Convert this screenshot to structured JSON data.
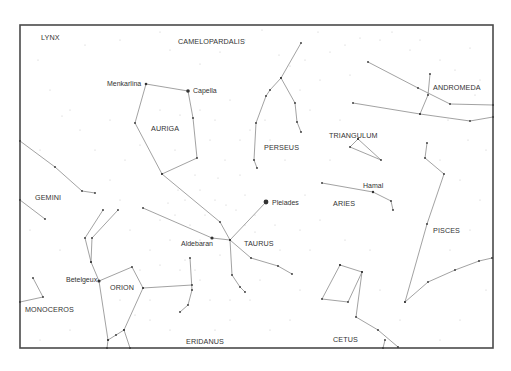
{
  "map": {
    "frame": {
      "x": 20,
      "y": 25,
      "width": 473,
      "height": 323
    },
    "colors": {
      "frame": "#4a4a4a",
      "lines": "#8a8a8a",
      "stars": "#333333",
      "background": "#ffffff"
    },
    "constellation_labels": [
      {
        "name": "LYNX",
        "x": 41,
        "y": 40
      },
      {
        "name": "CAMELOPARDALIS",
        "x": 178,
        "y": 44
      },
      {
        "name": "AURIGA",
        "x": 151,
        "y": 131
      },
      {
        "name": "PERSEUS",
        "x": 264,
        "y": 150
      },
      {
        "name": "TRIANGULUM",
        "x": 329,
        "y": 138
      },
      {
        "name": "ANDROMEDA",
        "x": 433,
        "y": 90
      },
      {
        "name": "GEMINI",
        "x": 35,
        "y": 200
      },
      {
        "name": "ARIES",
        "x": 333,
        "y": 206
      },
      {
        "name": "TAURUS",
        "x": 244,
        "y": 246
      },
      {
        "name": "PISCES",
        "x": 433,
        "y": 233
      },
      {
        "name": "ORION",
        "x": 110,
        "y": 290
      },
      {
        "name": "MONOCEROS",
        "x": 25,
        "y": 312
      },
      {
        "name": "ERIDANUS",
        "x": 186,
        "y": 344
      },
      {
        "name": "CETUS",
        "x": 333,
        "y": 342
      }
    ],
    "star_labels": [
      {
        "name": "Menkarlina",
        "x": 107,
        "y": 86,
        "anchor": "start"
      },
      {
        "name": "Capella",
        "x": 193,
        "y": 93,
        "anchor": "start"
      },
      {
        "name": "Pleiades",
        "x": 272,
        "y": 205,
        "anchor": "start"
      },
      {
        "name": "Hamal",
        "x": 363,
        "y": 188,
        "anchor": "start"
      },
      {
        "name": "Aldebaran",
        "x": 181,
        "y": 246,
        "anchor": "start"
      },
      {
        "name": "Betelgeux",
        "x": 66,
        "y": 282,
        "anchor": "start"
      }
    ],
    "named_stars": [
      {
        "name": "Menkarlina",
        "x": 146,
        "y": 84,
        "r": 1.3
      },
      {
        "name": "Capella",
        "x": 188,
        "y": 91,
        "r": 1.8
      },
      {
        "name": "Pleiades",
        "x": 266,
        "y": 202,
        "r": 2.4
      },
      {
        "name": "Hamal",
        "x": 373,
        "y": 192,
        "r": 1.2
      },
      {
        "name": "Aldebaran",
        "x": 212,
        "y": 238,
        "r": 1.6
      },
      {
        "name": "Betelgeux",
        "x": 99,
        "y": 281,
        "r": 1.6
      }
    ],
    "constellation_lines": [
      {
        "name": "auriga",
        "points": [
          [
            146,
            84
          ],
          [
            188,
            91
          ],
          [
            193,
            118
          ],
          [
            197,
            158
          ],
          [
            162,
            174
          ],
          [
            135,
            123
          ],
          [
            146,
            84
          ]
        ]
      },
      {
        "name": "auriga-taurus",
        "points": [
          [
            162,
            174
          ],
          [
            220,
            222
          ],
          [
            230,
            240
          ]
        ]
      },
      {
        "name": "perseus-main",
        "points": [
          [
            301,
            43
          ],
          [
            281,
            78
          ],
          [
            270,
            90
          ],
          [
            266,
            96
          ],
          [
            256,
            123
          ],
          [
            254,
            160
          ],
          [
            257,
            168
          ]
        ]
      },
      {
        "name": "perseus-branch",
        "points": [
          [
            281,
            78
          ],
          [
            295,
            103
          ],
          [
            297,
            122
          ],
          [
            301,
            132
          ]
        ]
      },
      {
        "name": "andromeda-upper",
        "points": [
          [
            368,
            62
          ],
          [
            418,
            88
          ],
          [
            450,
            104
          ],
          [
            493,
            105
          ]
        ]
      },
      {
        "name": "andromeda-lower",
        "points": [
          [
            353,
            103
          ],
          [
            420,
            114
          ],
          [
            470,
            121
          ],
          [
            493,
            117
          ]
        ]
      },
      {
        "name": "andromeda-branch",
        "points": [
          [
            430,
            74
          ],
          [
            428,
            95
          ],
          [
            420,
            114
          ]
        ]
      },
      {
        "name": "triangulum",
        "points": [
          [
            358,
            139
          ],
          [
            350,
            147
          ],
          [
            381,
            160
          ],
          [
            358,
            139
          ]
        ]
      },
      {
        "name": "aries",
        "points": [
          [
            322,
            183
          ],
          [
            373,
            192
          ],
          [
            391,
            201
          ],
          [
            393,
            210
          ]
        ]
      },
      {
        "name": "pisces-vertical",
        "points": [
          [
            427,
            143
          ],
          [
            425,
            158
          ],
          [
            444,
            174
          ],
          [
            427,
            224
          ],
          [
            405,
            302
          ]
        ]
      },
      {
        "name": "pisces-arc",
        "points": [
          [
            405,
            302
          ],
          [
            428,
            282
          ],
          [
            455,
            270
          ],
          [
            479,
            261
          ],
          [
            492,
            258
          ]
        ]
      },
      {
        "name": "cetus-box",
        "points": [
          [
            340,
            265
          ],
          [
            362,
            272
          ],
          [
            348,
            302
          ],
          [
            322,
            299
          ],
          [
            340,
            265
          ]
        ]
      },
      {
        "name": "cetus-tail",
        "points": [
          [
            362,
            272
          ],
          [
            356,
            317
          ],
          [
            378,
            330
          ],
          [
            398,
            347
          ]
        ]
      },
      {
        "name": "cetus-tick",
        "points": [
          [
            385,
            340
          ],
          [
            383,
            348
          ]
        ]
      },
      {
        "name": "taurus-pleiades",
        "points": [
          [
            230,
            240
          ],
          [
            266,
            202
          ]
        ]
      },
      {
        "name": "taurus-horn",
        "points": [
          [
            230,
            240
          ],
          [
            251,
            258
          ],
          [
            278,
            266
          ],
          [
            292,
            274
          ]
        ]
      },
      {
        "name": "taurus-aldebaran",
        "points": [
          [
            143,
            208
          ],
          [
            212,
            238
          ],
          [
            230,
            240
          ]
        ]
      },
      {
        "name": "taurus-lower",
        "points": [
          [
            230,
            240
          ],
          [
            232,
            275
          ],
          [
            240,
            287
          ],
          [
            245,
            292
          ]
        ]
      },
      {
        "name": "gemini-upper",
        "points": [
          [
            20,
            141
          ],
          [
            55,
            167
          ],
          [
            82,
            191
          ],
          [
            95,
            193
          ]
        ]
      },
      {
        "name": "gemini-lower",
        "points": [
          [
            20,
            200
          ],
          [
            45,
            219
          ]
        ]
      },
      {
        "name": "orion-shield",
        "points": [
          [
            190,
            258
          ],
          [
            192,
            290
          ],
          [
            188,
            305
          ],
          [
            180,
            312
          ]
        ]
      },
      {
        "name": "orion-belt-arm",
        "points": [
          [
            143,
            288
          ],
          [
            192,
            285
          ]
        ]
      },
      {
        "name": "orion-body",
        "points": [
          [
            99,
            281
          ],
          [
            132,
            267
          ],
          [
            143,
            288
          ],
          [
            124,
            330
          ],
          [
            116,
            335
          ],
          [
            108,
            340
          ]
        ]
      },
      {
        "name": "orion-left",
        "points": [
          [
            99,
            281
          ],
          [
            91,
            262
          ],
          [
            85,
            238
          ],
          [
            103,
            210
          ]
        ]
      },
      {
        "name": "orion-club",
        "points": [
          [
            91,
            262
          ],
          [
            92,
            238
          ],
          [
            118,
            210
          ]
        ]
      },
      {
        "name": "orion-leg",
        "points": [
          [
            99,
            281
          ],
          [
            108,
            340
          ],
          [
            107,
            348
          ]
        ]
      },
      {
        "name": "orion-foot",
        "points": [
          [
            124,
            330
          ],
          [
            130,
            348
          ]
        ]
      },
      {
        "name": "monoceros",
        "points": [
          [
            20,
            302
          ],
          [
            43,
            297
          ],
          [
            33,
            278
          ]
        ]
      }
    ],
    "background_stars": [
      [
        38,
        60
      ],
      [
        62,
        116
      ],
      [
        85,
        45
      ],
      [
        120,
        40
      ],
      [
        160,
        32
      ],
      [
        170,
        50
      ],
      [
        200,
        64
      ],
      [
        220,
        52
      ],
      [
        245,
        40
      ],
      [
        262,
        30
      ],
      [
        279,
        55
      ],
      [
        290,
        66
      ],
      [
        305,
        60
      ],
      [
        318,
        32
      ],
      [
        330,
        52
      ],
      [
        345,
        45
      ],
      [
        360,
        38
      ],
      [
        380,
        40
      ],
      [
        392,
        32
      ],
      [
        410,
        50
      ],
      [
        420,
        40
      ],
      [
        440,
        60
      ],
      [
        455,
        70
      ],
      [
        470,
        48
      ],
      [
        480,
        80
      ],
      [
        475,
        95
      ],
      [
        468,
        140
      ],
      [
        486,
        150
      ],
      [
        448,
        120
      ],
      [
        440,
        160
      ],
      [
        460,
        180
      ],
      [
        480,
        200
      ],
      [
        470,
        230
      ],
      [
        450,
        250
      ],
      [
        486,
        290
      ],
      [
        460,
        320
      ],
      [
        440,
        340
      ],
      [
        400,
        320
      ],
      [
        380,
        290
      ],
      [
        370,
        250
      ],
      [
        345,
        240
      ],
      [
        320,
        220
      ],
      [
        310,
        250
      ],
      [
        300,
        290
      ],
      [
        290,
        320
      ],
      [
        270,
        330
      ],
      [
        250,
        300
      ],
      [
        230,
        320
      ],
      [
        210,
        300
      ],
      [
        200,
        280
      ],
      [
        180,
        270
      ],
      [
        170,
        240
      ],
      [
        160,
        220
      ],
      [
        150,
        250
      ],
      [
        140,
        270
      ],
      [
        130,
        230
      ],
      [
        120,
        200
      ],
      [
        110,
        180
      ],
      [
        95,
        150
      ],
      [
        80,
        130
      ],
      [
        70,
        110
      ],
      [
        50,
        90
      ],
      [
        40,
        150
      ],
      [
        30,
        230
      ],
      [
        60,
        250
      ],
      [
        70,
        330
      ],
      [
        40,
        340
      ],
      [
        150,
        320
      ],
      [
        170,
        330
      ],
      [
        215,
        330
      ],
      [
        230,
        300
      ],
      [
        260,
        280
      ],
      [
        280,
        250
      ],
      [
        300,
        230
      ],
      [
        330,
        160
      ],
      [
        340,
        120
      ],
      [
        310,
        110
      ],
      [
        300,
        90
      ],
      [
        320,
        80
      ],
      [
        350,
        75
      ],
      [
        230,
        100
      ],
      [
        215,
        120
      ],
      [
        210,
        140
      ],
      [
        225,
        160
      ],
      [
        240,
        175
      ],
      [
        245,
        195
      ],
      [
        255,
        215
      ],
      [
        275,
        225
      ],
      [
        290,
        205
      ],
      [
        305,
        195
      ],
      [
        200,
        190
      ],
      [
        185,
        200
      ],
      [
        175,
        215
      ],
      [
        190,
        225
      ],
      [
        205,
        215
      ],
      [
        215,
        200
      ],
      [
        175,
        150
      ],
      [
        170,
        130
      ],
      [
        180,
        115
      ],
      [
        160,
        110
      ],
      [
        140,
        145
      ],
      [
        125,
        160
      ],
      [
        110,
        120
      ],
      [
        200,
        110
      ],
      [
        265,
        120
      ],
      [
        270,
        140
      ],
      [
        285,
        160
      ],
      [
        240,
        140
      ],
      [
        250,
        130
      ],
      [
        185,
        260
      ],
      [
        195,
        270
      ],
      [
        160,
        265
      ],
      [
        150,
        300
      ],
      [
        135,
        315
      ],
      [
        120,
        300
      ],
      [
        200,
        240
      ],
      [
        220,
        255
      ],
      [
        255,
        232
      ],
      [
        245,
        225
      ],
      [
        236,
        210
      ],
      [
        226,
        205
      ],
      [
        218,
        178
      ],
      [
        195,
        175
      ],
      [
        178,
        190
      ],
      [
        168,
        203
      ]
    ]
  }
}
